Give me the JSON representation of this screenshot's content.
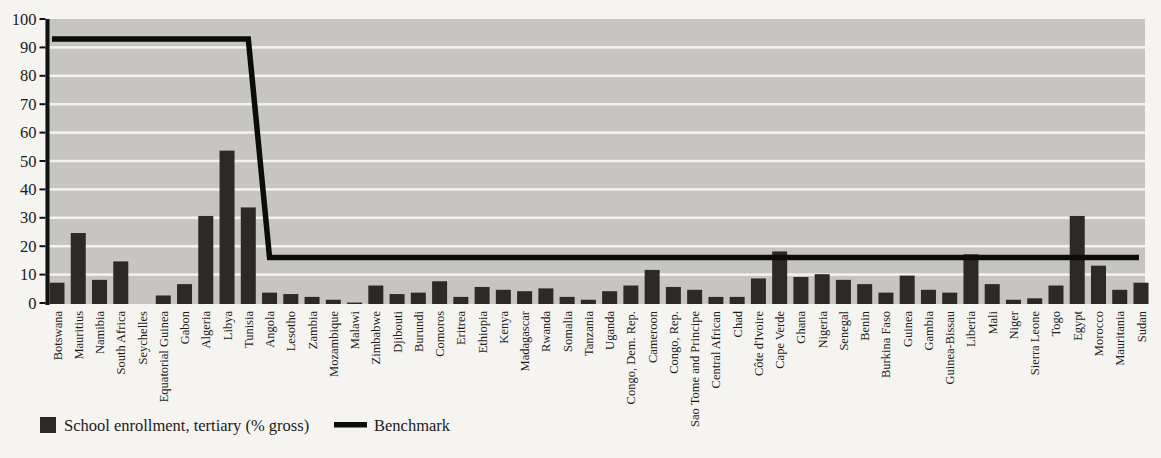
{
  "page": {
    "background": "#f5f4f0"
  },
  "legend": {
    "series_label": "School enrollment, tertiary (% gross)",
    "benchmark_label": "Benchmark"
  },
  "colors": {
    "bar": "#2d2926",
    "benchmark_line": "#0c0c0c",
    "plot_background": "#c6c5c2",
    "gridline": "#f4f3f0",
    "axis": "#111111"
  },
  "chart_data": {
    "type": "bar",
    "title": "",
    "xlabel": "",
    "ylabel": "",
    "ylim": [
      0,
      100
    ],
    "y_ticks": [
      0,
      10,
      20,
      30,
      40,
      50,
      60,
      70,
      80,
      90,
      100
    ],
    "grid": "horizontal white gridlines on gray plot area",
    "legend_position": "bottom-left",
    "categories": [
      "Botswana",
      "Mauritius",
      "Namibia",
      "South Africa",
      "Seychelles",
      "Equatorial Guinea",
      "Gabon",
      "Algeria",
      "Libya",
      "Tunisia",
      "Angola",
      "Lesotho",
      "Zambia",
      "Mozambique",
      "Malawi",
      "Zimbabwe",
      "Djibouti",
      "Burundi",
      "Comoros",
      "Eritrea",
      "Ethiopia",
      "Kenya",
      "Madagascar",
      "Rwanda",
      "Somalia",
      "Tanzania",
      "Uganda",
      "Congo, Dem. Rep.",
      "Cameroon",
      "Congo, Rep.",
      "Sao Tome and Principe",
      "Central African",
      "Chad",
      "Côte d'Ivoire",
      "Cape Verde",
      "Ghana",
      "Nigeria",
      "Senegal",
      "Benin",
      "Burkina Faso",
      "Guinea",
      "Gambia",
      "Guinea-Bissau",
      "Liberia",
      "Mali",
      "Niger",
      "Sierra Leone",
      "Togo",
      "Egypt",
      "Morocco",
      "Mauritania",
      "Sudan"
    ],
    "series": [
      {
        "name": "School enrollment, tertiary (% gross)",
        "type": "bar",
        "color": "#2d2926",
        "values": [
          7.5,
          25,
          8.5,
          15,
          0,
          3,
          7,
          31,
          54,
          34,
          4,
          3.5,
          2.5,
          1.5,
          0.5,
          6.5,
          3.5,
          4,
          8,
          2.5,
          6,
          5,
          4.5,
          5.5,
          2.5,
          1.5,
          4.5,
          6.5,
          12,
          6,
          5,
          2.5,
          2.5,
          9,
          18.5,
          9.5,
          10.5,
          8.5,
          7,
          4,
          10,
          5,
          4,
          17.5,
          7,
          1.5,
          2,
          6.5,
          31,
          13.5,
          5,
          7.5
        ]
      },
      {
        "name": "Benchmark",
        "type": "line",
        "color": "#0c0c0c",
        "values": [
          93,
          93,
          93,
          93,
          93,
          93,
          93,
          93,
          93,
          93,
          16,
          16,
          16,
          16,
          16,
          16,
          16,
          16,
          16,
          16,
          16,
          16,
          16,
          16,
          16,
          16,
          16,
          16,
          16,
          16,
          16,
          16,
          16,
          16,
          16,
          16,
          16,
          16,
          16,
          16,
          16,
          16,
          16,
          16,
          16,
          16,
          16,
          16,
          16,
          16,
          16,
          16
        ]
      }
    ]
  }
}
